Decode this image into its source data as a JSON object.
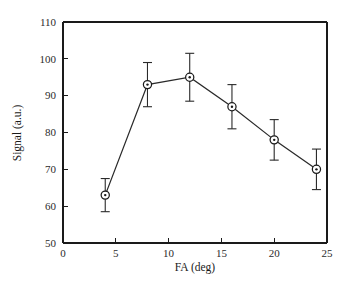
{
  "chart_data": {
    "type": "line",
    "title": "",
    "subtitle": "",
    "xlabel": "FA (deg)",
    "ylabel": "Signal (a.u.)",
    "x": [
      4,
      8,
      12,
      16,
      20,
      24
    ],
    "values": [
      63,
      93,
      95,
      87,
      78,
      70
    ],
    "series": [
      {
        "name": "Signal",
        "x": [
          4,
          8,
          12,
          16,
          20,
          24
        ],
        "values": [
          63,
          93,
          95,
          87,
          78,
          70
        ],
        "error": [
          4.5,
          6.0,
          6.5,
          6.0,
          5.5,
          5.5
        ],
        "marker": "circle-dot",
        "line_color": "#2a2a2a",
        "marker_face_color": "#ffffff",
        "marker_edge_color": "#1a1a1a"
      }
    ],
    "xlim": [
      0,
      25
    ],
    "ylim": [
      50,
      110
    ],
    "xticks": [
      0,
      5,
      10,
      15,
      20,
      25
    ],
    "yticks": [
      50,
      60,
      70,
      80,
      90,
      100,
      110
    ],
    "xtick_labels": [
      "0",
      "5",
      "10",
      "15",
      "20",
      "25"
    ],
    "ytick_labels": [
      "50",
      "60",
      "70",
      "80",
      "90",
      "100",
      "110"
    ],
    "grid": false,
    "legend": false,
    "legend_position": "none",
    "annotations": [],
    "background_color": "#ffffff",
    "axis_color": "#1a1a1a"
  },
  "axes": {
    "x_title": "FA (deg)",
    "y_title": "Signal (a.u.)"
  },
  "ticks": {
    "x": [
      "0",
      "5",
      "10",
      "15",
      "20",
      "25"
    ],
    "y": [
      "50",
      "60",
      "70",
      "80",
      "90",
      "100",
      "110"
    ]
  }
}
